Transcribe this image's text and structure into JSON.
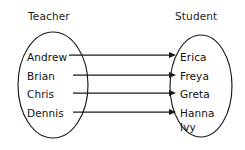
{
  "diagram": {
    "type": "set-mapping-diagram",
    "sets": [
      {
        "id": "teacher",
        "label": "Teacher",
        "label_x": 28,
        "label_y": 20,
        "ellipse": {
          "cx": 53,
          "cy": 85,
          "rx": 35,
          "ry": 53
        },
        "members": [
          {
            "name": "Andrew",
            "x": 27,
            "y": 61
          },
          {
            "name": "Brian",
            "x": 27,
            "y": 80
          },
          {
            "name": "Chris",
            "x": 27,
            "y": 98
          },
          {
            "name": "Dennis",
            "x": 27,
            "y": 117
          }
        ]
      },
      {
        "id": "student",
        "label": "Student",
        "label_x": 175,
        "label_y": 20,
        "ellipse": {
          "cx": 201,
          "cy": 86,
          "rx": 31,
          "ry": 51
        },
        "members": [
          {
            "name": "Erica",
            "x": 180,
            "y": 61
          },
          {
            "name": "Freya",
            "x": 180,
            "y": 80
          },
          {
            "name": "Greta",
            "x": 180,
            "y": 98
          },
          {
            "name": "Hanna",
            "x": 180,
            "y": 117
          },
          {
            "name": "Ivy",
            "x": 180,
            "y": 131
          }
        ]
      }
    ],
    "edges": [
      {
        "from": "Andrew",
        "to": "Erica",
        "x1": 69,
        "y1": 55,
        "x2": 176,
        "y2": 55
      },
      {
        "from": "Brian",
        "to": "Freya",
        "x1": 73,
        "y1": 75,
        "x2": 176,
        "y2": 75
      },
      {
        "from": "Chris",
        "to": "Greta",
        "x1": 73,
        "y1": 93,
        "x2": 176,
        "y2": 93
      },
      {
        "from": "Dennis",
        "to": "Hanna",
        "x1": 73,
        "y1": 112,
        "x2": 176,
        "y2": 112
      }
    ],
    "unmapped_members": [
      "Ivy"
    ],
    "colors": {
      "stroke": "#1a1a1a",
      "text": "#111111",
      "background": "#ffffff"
    }
  }
}
